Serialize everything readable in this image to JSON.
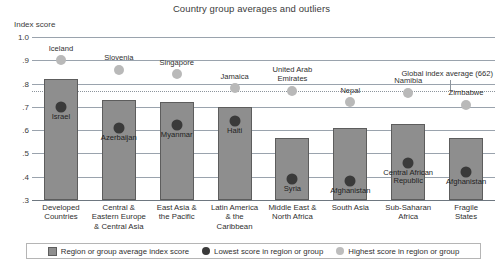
{
  "chart_data": {
    "type": "bar",
    "title": "Country group averages and outliers",
    "xlabel": "",
    "ylabel": "Index score",
    "ylim": [
      0.3,
      1.0
    ],
    "yticks": [
      "1.0",
      ".9",
      ".8",
      ".7",
      ".6",
      ".5",
      ".4",
      ".3"
    ],
    "ytick_values": [
      1.0,
      0.9,
      0.8,
      0.7,
      0.6,
      0.5,
      0.4,
      0.3
    ],
    "grid": true,
    "legend_position": "bottom",
    "categories": [
      "Developed Countries",
      "Central & Eastern Europe & Central Asia",
      "East Asia & the Pacific",
      "Latin America & the Caribbean",
      "Middle East & North Africa",
      "South Asia",
      "Sub-Saharan Africa",
      "Fragile States"
    ],
    "category_lines": [
      [
        "Developed",
        "Countries"
      ],
      [
        "Central &",
        "Eastern Europe",
        "& Central Asia"
      ],
      [
        "East Asia &",
        "the Pacific"
      ],
      [
        "Latin America",
        "& the",
        "Caribbean"
      ],
      [
        "Middle East &",
        "North Africa"
      ],
      [
        "South Asia"
      ],
      [
        "Sub-Saharan",
        "Africa"
      ],
      [
        "Fragile",
        "States"
      ]
    ],
    "series": [
      {
        "name": "Region or group average index score",
        "type": "bar",
        "values": [
          0.82,
          0.73,
          0.72,
          0.7,
          0.565,
          0.61,
          0.625,
          0.565
        ]
      },
      {
        "name": "Lowest score in region or group",
        "type": "scatter",
        "values": [
          0.7,
          0.61,
          0.62,
          0.64,
          0.39,
          0.38,
          0.46,
          0.42
        ],
        "labels": [
          "Israel",
          "Azerbaijan",
          "Myanmar",
          "Haiti",
          "Syria",
          "Afghanistan",
          "Central African Republic",
          "Afghanistan"
        ],
        "label_lines": [
          [
            "Israel"
          ],
          [
            "Azerbaijan"
          ],
          [
            "Myanmar"
          ],
          [
            "Haiti"
          ],
          [
            "Syria"
          ],
          [
            "Afghanistan"
          ],
          [
            "Central African",
            "Republic"
          ],
          [
            "Afghanistan"
          ]
        ]
      },
      {
        "name": "Highest score in region or group",
        "type": "scatter",
        "values": [
          0.9,
          0.86,
          0.84,
          0.78,
          0.77,
          0.72,
          0.76,
          0.71
        ],
        "labels": [
          "Iceland",
          "Slovenia",
          "Singapore",
          "Jamaica",
          "United Arab Emirates",
          "Nepal",
          "Namibia",
          "Zimbabwe"
        ],
        "label_lines": [
          [
            "Iceland"
          ],
          [
            "Slovenia"
          ],
          [
            "Singapore"
          ],
          [
            "Jamaica"
          ],
          [
            "United Arab",
            "Emirates"
          ],
          [
            "Nepal"
          ],
          [
            "Namibia"
          ],
          [
            "Zimbabwe"
          ]
        ]
      }
    ],
    "annotations": [
      {
        "name": "global-index-average",
        "text": "Global index average (662)",
        "value": 0.77,
        "style": "dotted-horizontal-line"
      }
    ],
    "colors": {
      "bar_fill": "#8e8e8e",
      "bar_stroke": "#5d5d5d",
      "low_dot": "#3a3a3a",
      "high_dot": "#b9b9b9",
      "gridline": "#9aa3ad",
      "text": "#2f2f2f"
    }
  },
  "legend": {
    "items": [
      {
        "label": "Region or group average index score",
        "marker": "bar-swatch"
      },
      {
        "label": "Lowest score in region or group",
        "marker": "dark-dot"
      },
      {
        "label": "Highest score in region or group",
        "marker": "light-dot"
      }
    ]
  }
}
